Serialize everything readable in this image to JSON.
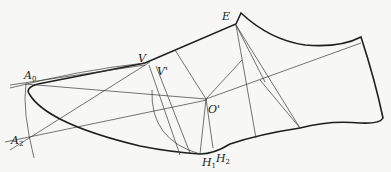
{
  "diagram": {
    "points": {
      "A0": {
        "label": "A",
        "sub": "0",
        "x": 25,
        "y": 84
      },
      "A2": {
        "label": "A",
        "sub": "2",
        "x": 30,
        "y": 140
      },
      "V": {
        "label": "V",
        "x": 145,
        "y": 63
      },
      "Vprime": {
        "label": "V'",
        "x": 152,
        "y": 66
      },
      "E": {
        "label": "E",
        "x": 236,
        "y": 24
      },
      "Oprime": {
        "label": "O'",
        "x": 206,
        "y": 99
      },
      "H1": {
        "label": "H",
        "sub": "1",
        "x": 200,
        "y": 154
      },
      "H2": {
        "label": "H",
        "sub": "2",
        "x": 213,
        "y": 148
      }
    },
    "labels": {
      "A0": "A",
      "A0_sub": "0",
      "A2": "A",
      "A2_sub": "2",
      "V": "V",
      "Vprime": "V'",
      "E": "E",
      "Oprime": "O'",
      "H1": "H",
      "H1_sub": "1",
      "H2": "H",
      "H2_sub": "2"
    },
    "colors": {
      "background": "#f7f7f5",
      "outline": "#1e1e1e",
      "construction": "#3a3a3a"
    }
  }
}
